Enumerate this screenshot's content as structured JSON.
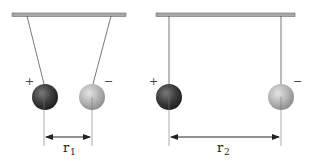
{
  "diagram": {
    "left_panel": {
      "positive_sign": "+",
      "negative_sign": "−",
      "distance_label": "r",
      "distance_subscript": "1"
    },
    "right_panel": {
      "positive_sign": "+",
      "negative_sign": "−",
      "distance_label": "r",
      "distance_subscript": "2"
    },
    "colors": {
      "support_bar": "#a8a8a8",
      "string": "#555555",
      "positive_sphere": "#3a3a3a",
      "negative_sphere": "#b8b8b8",
      "dimension_line": "#222222"
    }
  }
}
